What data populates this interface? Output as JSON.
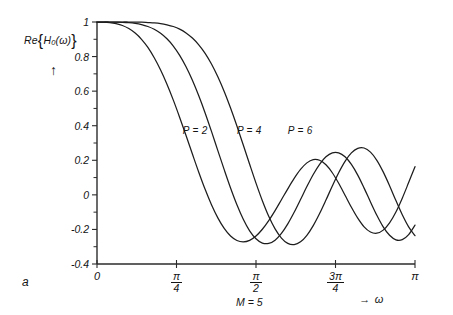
{
  "figure": {
    "panel_label": "a",
    "annotation_m": "M = 5"
  },
  "axes": {
    "y_axis_label_prefix": "Re",
    "y_axis_label_brace_open": "{",
    "y_axis_label_func": "H",
    "y_axis_label_sub": "0",
    "y_axis_label_arg": "(ω)",
    "y_axis_label_brace_close": "}",
    "y_axis_direction_arrow": "↑",
    "x_axis_arrow": "→",
    "x_axis_label": "ω",
    "y_ticks": [
      {
        "label": "1",
        "value": 1
      },
      {
        "label": "0.8",
        "value": 0.8
      },
      {
        "label": "0.6",
        "value": 0.6
      },
      {
        "label": "0.4",
        "value": 0.4
      },
      {
        "label": "0.2",
        "value": 0.2
      },
      {
        "label": "0",
        "value": 0
      },
      {
        "label": "-0.2",
        "value": -0.2
      },
      {
        "label": "-0.4",
        "value": -0.4
      }
    ],
    "x_ticks": [
      {
        "label": "0",
        "num": "0",
        "den": "",
        "value": 0
      },
      {
        "label": "π/4",
        "num": "π",
        "den": "4",
        "value": 0.25
      },
      {
        "label": "π/2",
        "num": "π",
        "den": "2",
        "value": 0.5
      },
      {
        "label": "3π/4",
        "num": "3π",
        "den": "4",
        "value": 0.75
      },
      {
        "label": "π",
        "num": "π",
        "den": "",
        "value": 1
      }
    ]
  },
  "curve_labels": [
    {
      "text": "P = 2"
    },
    {
      "text": "P = 4"
    },
    {
      "text": "P = 6"
    }
  ],
  "chart_data": {
    "type": "line",
    "title": "",
    "xlabel": "ω",
    "ylabel": "Re{H0(ω)}",
    "xlim": [
      0,
      1
    ],
    "ylim": [
      -0.4,
      1
    ],
    "xtick_labels": [
      "0",
      "π/4",
      "π/2",
      "3π/4",
      "π"
    ],
    "xtick_values": [
      0,
      0.25,
      0.5,
      0.75,
      1
    ],
    "ytick_labels": [
      "1",
      "0.8",
      "0.6",
      "0.4",
      "0.2",
      "0",
      "-0.2",
      "-0.4"
    ],
    "ytick_values": [
      1,
      0.8,
      0.6,
      0.4,
      0.2,
      0,
      -0.2,
      -0.4
    ],
    "x_units": "fraction of π",
    "grid": false,
    "legend": "inline-curve-labels",
    "annotations": [
      {
        "text": "M = 5",
        "x": 0.5,
        "y": -0.52
      },
      {
        "text": "a",
        "x": -0.15,
        "y": -0.5
      }
    ],
    "series": [
      {
        "name": "P = 2",
        "label": "P = 2",
        "label_x": 0.27,
        "label_y": 0.37,
        "x": [
          0,
          0.02,
          0.04,
          0.06,
          0.08,
          0.1,
          0.12,
          0.14,
          0.16,
          0.18,
          0.2,
          0.22,
          0.24,
          0.26,
          0.28,
          0.3,
          0.32,
          0.34,
          0.36,
          0.38,
          0.4,
          0.42,
          0.44,
          0.46,
          0.48,
          0.5,
          0.52,
          0.54,
          0.56,
          0.58,
          0.6,
          0.62,
          0.64,
          0.66,
          0.68,
          0.7,
          0.72,
          0.74,
          0.76,
          0.78,
          0.8,
          0.82,
          0.84,
          0.86,
          0.88,
          0.9,
          0.92,
          0.94,
          0.96,
          0.98,
          1.0
        ],
        "y": [
          1.0,
          0.999,
          0.996,
          0.99,
          0.98,
          0.962,
          0.936,
          0.9,
          0.853,
          0.793,
          0.722,
          0.64,
          0.548,
          0.448,
          0.343,
          0.236,
          0.131,
          0.032,
          -0.057,
          -0.133,
          -0.194,
          -0.238,
          -0.264,
          -0.272,
          -0.263,
          -0.238,
          -0.199,
          -0.149,
          -0.091,
          -0.028,
          0.035,
          0.095,
          0.147,
          0.185,
          0.204,
          0.2,
          0.174,
          0.128,
          0.067,
          -0.002,
          -0.072,
          -0.135,
          -0.185,
          -0.215,
          -0.222,
          -0.204,
          -0.162,
          -0.099,
          -0.019,
          0.071,
          0.163
        ]
      },
      {
        "name": "P = 4",
        "label": "P = 4",
        "label_x": 0.44,
        "label_y": 0.37,
        "x": [
          0,
          0.02,
          0.04,
          0.06,
          0.08,
          0.1,
          0.12,
          0.14,
          0.16,
          0.18,
          0.2,
          0.22,
          0.24,
          0.26,
          0.28,
          0.3,
          0.32,
          0.34,
          0.36,
          0.38,
          0.4,
          0.42,
          0.44,
          0.46,
          0.48,
          0.5,
          0.52,
          0.54,
          0.56,
          0.58,
          0.6,
          0.62,
          0.64,
          0.66,
          0.68,
          0.7,
          0.72,
          0.74,
          0.76,
          0.78,
          0.8,
          0.82,
          0.84,
          0.86,
          0.88,
          0.9,
          0.92,
          0.94,
          0.96,
          0.98,
          1.0
        ],
        "y": [
          1.0,
          1.0,
          1.0,
          0.999,
          0.998,
          0.996,
          0.992,
          0.985,
          0.974,
          0.958,
          0.935,
          0.903,
          0.861,
          0.807,
          0.741,
          0.663,
          0.573,
          0.474,
          0.367,
          0.256,
          0.146,
          0.04,
          -0.057,
          -0.141,
          -0.208,
          -0.254,
          -0.279,
          -0.281,
          -0.262,
          -0.223,
          -0.168,
          -0.101,
          -0.027,
          0.048,
          0.118,
          0.177,
          0.22,
          0.243,
          0.243,
          0.22,
          0.176,
          0.114,
          0.039,
          -0.041,
          -0.118,
          -0.185,
          -0.234,
          -0.26,
          -0.259,
          -0.23,
          -0.175
        ]
      },
      {
        "name": "P = 6",
        "label": "P = 6",
        "label_x": 0.6,
        "label_y": 0.37,
        "x": [
          0,
          0.02,
          0.04,
          0.06,
          0.08,
          0.1,
          0.12,
          0.14,
          0.16,
          0.18,
          0.2,
          0.22,
          0.24,
          0.26,
          0.28,
          0.3,
          0.32,
          0.34,
          0.36,
          0.38,
          0.4,
          0.42,
          0.44,
          0.46,
          0.48,
          0.5,
          0.52,
          0.54,
          0.56,
          0.58,
          0.6,
          0.62,
          0.64,
          0.66,
          0.68,
          0.7,
          0.72,
          0.74,
          0.76,
          0.78,
          0.8,
          0.82,
          0.84,
          0.86,
          0.88,
          0.9,
          0.92,
          0.94,
          0.96,
          0.98,
          1.0
        ],
        "y": [
          1.0,
          1.0,
          1.0,
          1.0,
          1.0,
          1.0,
          0.999,
          0.999,
          0.997,
          0.995,
          0.991,
          0.984,
          0.974,
          0.959,
          0.937,
          0.907,
          0.868,
          0.819,
          0.757,
          0.683,
          0.598,
          0.502,
          0.398,
          0.288,
          0.177,
          0.068,
          -0.034,
          -0.124,
          -0.197,
          -0.25,
          -0.281,
          -0.288,
          -0.272,
          -0.234,
          -0.178,
          -0.108,
          -0.03,
          0.051,
          0.128,
          0.194,
          0.243,
          0.269,
          0.271,
          0.247,
          0.2,
          0.133,
          0.053,
          -0.033,
          -0.115,
          -0.185,
          -0.236
        ]
      }
    ]
  }
}
